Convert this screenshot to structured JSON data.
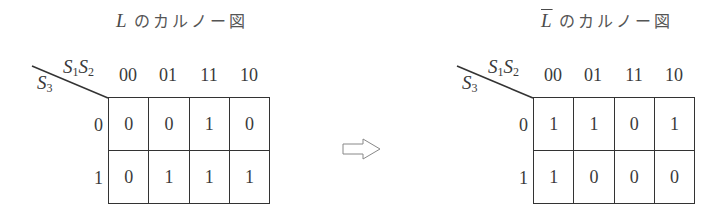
{
  "left_map": {
    "title_var": "L",
    "title_var_negated": false,
    "title_rest": "のカルノー図",
    "col_var": {
      "a": "S",
      "a_sub": "1",
      "b": "S",
      "b_sub": "2"
    },
    "row_var": {
      "a": "S",
      "a_sub": "3"
    },
    "col_headers": [
      "00",
      "01",
      "11",
      "10"
    ],
    "row_headers": [
      "0",
      "1"
    ],
    "cells": [
      [
        "0",
        "0",
        "1",
        "0"
      ],
      [
        "0",
        "1",
        "1",
        "1"
      ]
    ]
  },
  "arrow": {
    "icon": "hollow-right-arrow-icon",
    "glyph": "⇨"
  },
  "right_map": {
    "title_var": "L",
    "title_var_negated": true,
    "title_rest": "のカルノー図",
    "col_var": {
      "a": "S",
      "a_sub": "1",
      "b": "S",
      "b_sub": "2"
    },
    "row_var": {
      "a": "S",
      "a_sub": "3"
    },
    "col_headers": [
      "00",
      "01",
      "11",
      "10"
    ],
    "row_headers": [
      "0",
      "1"
    ],
    "cells": [
      [
        "1",
        "1",
        "0",
        "1"
      ],
      [
        "1",
        "0",
        "0",
        "0"
      ]
    ]
  }
}
